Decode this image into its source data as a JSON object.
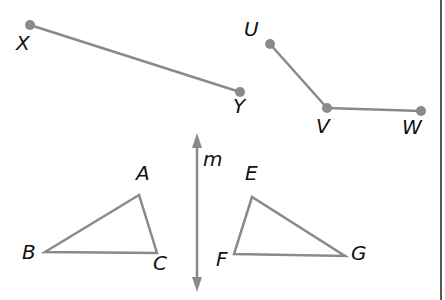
{
  "diagram": {
    "colors": {
      "stroke": "#8a8a8a",
      "point": "#8a8a8a",
      "label": "#111111",
      "border": "#222222"
    },
    "segments": [
      {
        "name": "XY",
        "from": "X",
        "to": "Y"
      },
      {
        "name": "UV",
        "from": "U",
        "to": "V"
      },
      {
        "name": "VW",
        "from": "V",
        "to": "W"
      }
    ],
    "labels": {
      "X": "X",
      "Y": "Y",
      "U": "U",
      "V": "V",
      "W": "W",
      "A": "A",
      "B": "B",
      "C": "C",
      "E": "E",
      "F": "F",
      "G": "G",
      "m": "m"
    },
    "triangles": [
      {
        "name": "ABC",
        "vertices": [
          "A",
          "B",
          "C"
        ]
      },
      {
        "name": "EFG",
        "vertices": [
          "E",
          "F",
          "G"
        ]
      }
    ],
    "line": {
      "name": "m",
      "type": "vertical line with arrows (line of reflection)"
    }
  }
}
